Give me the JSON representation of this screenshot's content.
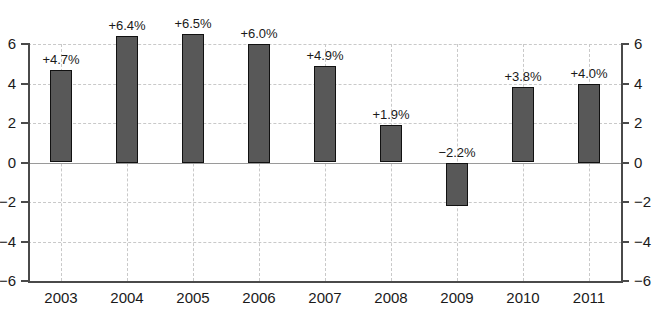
{
  "chart_data": {
    "type": "bar",
    "title": "",
    "subtitle": "",
    "xlabel": "",
    "ylabel": "",
    "categories": [
      "2003",
      "2004",
      "2005",
      "2006",
      "2007",
      "2008",
      "2009",
      "2010",
      "2011"
    ],
    "values": [
      4.7,
      6.4,
      6.5,
      6.0,
      4.9,
      1.9,
      -2.2,
      3.8,
      4.0
    ],
    "point_labels": [
      "+4.7%",
      "+6.4%",
      "+6.5%",
      "+6.0%",
      "+4.9%",
      "+1.9%",
      "−2.2%",
      "+3.8%",
      "+4.0%"
    ],
    "ylim": [
      -6,
      6
    ],
    "yticks": [
      6,
      4,
      2,
      0,
      -2,
      -4,
      -6
    ],
    "ytick_labels_left": [
      "6",
      "4",
      "2",
      "0",
      "−2",
      "−4",
      "−6"
    ],
    "ytick_labels_right": [
      "6",
      "4",
      "2",
      "0",
      "−2",
      "−4",
      "−6"
    ],
    "grid": true,
    "grid_style": "dashed",
    "legend": "none",
    "dual_axis": true,
    "colors": {
      "bar_fill": "#585858",
      "bar_border": "#111111",
      "grid": "#c9c9c9",
      "axis": "#4a4a4a",
      "zero_line": "#9a9a9a",
      "text": "#1a1a1a",
      "background": "#ffffff"
    }
  }
}
